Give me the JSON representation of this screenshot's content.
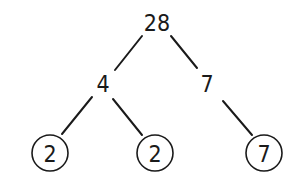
{
  "diagram": {
    "type": "factor-tree",
    "nodes": [
      {
        "id": "root",
        "label": "28",
        "x": 157,
        "y": 22,
        "circled": false
      },
      {
        "id": "left",
        "label": "4",
        "x": 103,
        "y": 83,
        "circled": false
      },
      {
        "id": "right",
        "label": "7",
        "x": 207,
        "y": 83,
        "circled": false
      },
      {
        "id": "left-left",
        "label": "2",
        "x": 50,
        "y": 153,
        "circled": true
      },
      {
        "id": "left-right",
        "label": "2",
        "x": 155,
        "y": 153,
        "circled": true
      },
      {
        "id": "right-child",
        "label": "7",
        "x": 264,
        "y": 153,
        "circled": true
      }
    ],
    "edges": [
      {
        "from": "root",
        "to": "left",
        "x1": 142,
        "y1": 36,
        "x2": 115,
        "y2": 70
      },
      {
        "from": "root",
        "to": "right",
        "x1": 171,
        "y1": 36,
        "x2": 197,
        "y2": 68
      },
      {
        "from": "left",
        "to": "left-left",
        "x1": 92,
        "y1": 97,
        "x2": 62,
        "y2": 134
      },
      {
        "from": "left",
        "to": "left-right",
        "x1": 113,
        "y1": 99,
        "x2": 142,
        "y2": 135
      },
      {
        "from": "right",
        "to": "right-child",
        "x1": 223,
        "y1": 101,
        "x2": 252,
        "y2": 135
      }
    ],
    "circle_radius": 18,
    "colors": {
      "ink": "#1a1a1a",
      "background": "#ffffff"
    }
  }
}
